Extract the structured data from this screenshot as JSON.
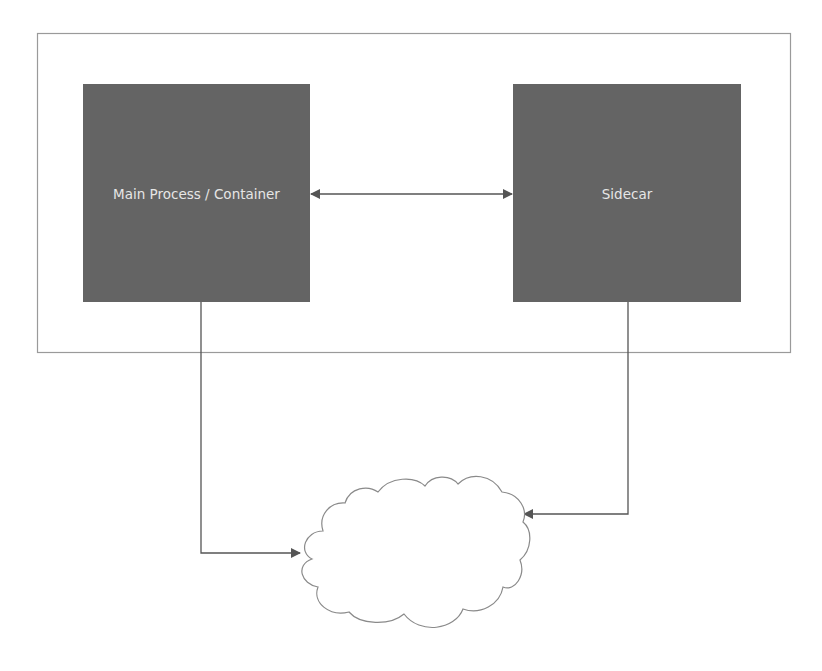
{
  "diagram": {
    "type": "architecture",
    "pattern": "sidecar",
    "container_group": {
      "label": ""
    },
    "nodes": [
      {
        "id": "main",
        "label": "Main Process / Container",
        "shape": "rectangle",
        "fill": "#646464"
      },
      {
        "id": "sidecar",
        "label": "Sidecar",
        "shape": "rectangle",
        "fill": "#646464"
      },
      {
        "id": "cloud",
        "label": "",
        "shape": "cloud",
        "fill": "#ffffff"
      }
    ],
    "edges": [
      {
        "from": "main",
        "to": "sidecar",
        "direction": "bidirectional"
      },
      {
        "from": "main",
        "to": "cloud",
        "direction": "forward"
      },
      {
        "from": "sidecar",
        "to": "cloud",
        "direction": "forward"
      }
    ],
    "colors": {
      "box_fill": "#646464",
      "box_text": "#e6e6e6",
      "line": "#555555",
      "group_border": "#9a9a9a",
      "cloud_stroke": "#8a8a8a"
    }
  }
}
